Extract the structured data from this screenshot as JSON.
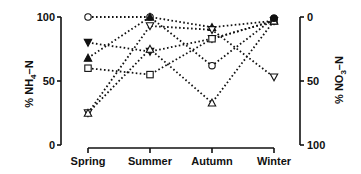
{
  "chart_data": {
    "type": "line",
    "title": "",
    "categories": [
      "Spring",
      "Summer",
      "Autumn",
      "Winter"
    ],
    "xlabel": "",
    "ylabel": "% NH4-N",
    "ylabel_right": "% NO3-N",
    "ylim": [
      0,
      100
    ],
    "ylim_right": [
      100,
      0
    ],
    "yticks": [
      "0",
      "50",
      "100"
    ],
    "yticks_right": [
      "0",
      "50",
      "100"
    ],
    "grid": false,
    "legend": "none",
    "line_style": "dotted",
    "series": [
      {
        "name": "open-circle",
        "marker": "circle-open",
        "values": [
          100,
          100,
          62,
          99
        ]
      },
      {
        "name": "filled-down-triangle",
        "marker": "triangle-down-filled",
        "values": [
          80,
          73,
          83,
          97
        ]
      },
      {
        "name": "filled-up-triangle",
        "marker": "triangle-up-filled",
        "values": [
          68,
          100,
          92,
          97
        ]
      },
      {
        "name": "open-square",
        "marker": "square-open",
        "values": [
          60,
          55,
          83,
          97
        ]
      },
      {
        "name": "open-down-triangle",
        "marker": "triangle-down-open",
        "values": [
          25,
          93,
          90,
          53
        ]
      },
      {
        "name": "open-up-triangle",
        "marker": "triangle-up-open",
        "values": [
          25,
          75,
          33,
          97
        ]
      },
      {
        "name": "filled-circle",
        "marker": "circle-filled",
        "values": [
          null,
          null,
          null,
          99
        ]
      }
    ]
  },
  "axes": {
    "left_label_main": "% NH",
    "left_label_sub": "4",
    "left_label_tail": "–N",
    "right_label_main": "% NO",
    "right_label_sub": "3",
    "right_label_tail": "–N"
  }
}
